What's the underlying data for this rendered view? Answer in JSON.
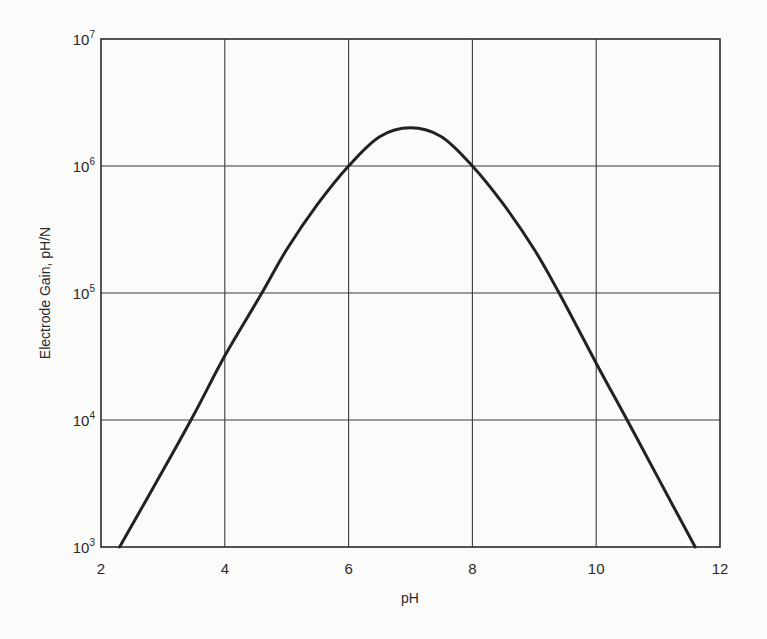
{
  "chart_data": {
    "type": "line",
    "title": "",
    "xlabel": "pH",
    "ylabel": "Electrode Gain, pH/N",
    "xlim": [
      2,
      12
    ],
    "ylim": [
      1000,
      10000000
    ],
    "yscale": "log",
    "grid": true,
    "legend": null,
    "x_ticks": [
      "2",
      "4",
      "6",
      "8",
      "10",
      "12"
    ],
    "y_ticks": [
      {
        "base": "10",
        "exp": "3"
      },
      {
        "base": "10",
        "exp": "4"
      },
      {
        "base": "10",
        "exp": "5"
      },
      {
        "base": "10",
        "exp": "6"
      },
      {
        "base": "10",
        "exp": "7"
      }
    ],
    "series": [
      {
        "name": "Electrode Gain",
        "x": [
          2.3,
          3.0,
          3.5,
          4.0,
          4.6,
          5.0,
          5.5,
          6.0,
          6.5,
          7.0,
          7.5,
          8.0,
          8.5,
          9.0,
          9.4,
          10.0,
          10.5,
          11.0,
          11.6
        ],
        "y": [
          1000,
          4000,
          11000,
          32000,
          100000,
          220000,
          500000,
          1000000,
          1700000,
          2000000,
          1700000,
          1000000,
          500000,
          220000,
          100000,
          28000,
          10000,
          3500,
          1000
        ]
      }
    ]
  }
}
